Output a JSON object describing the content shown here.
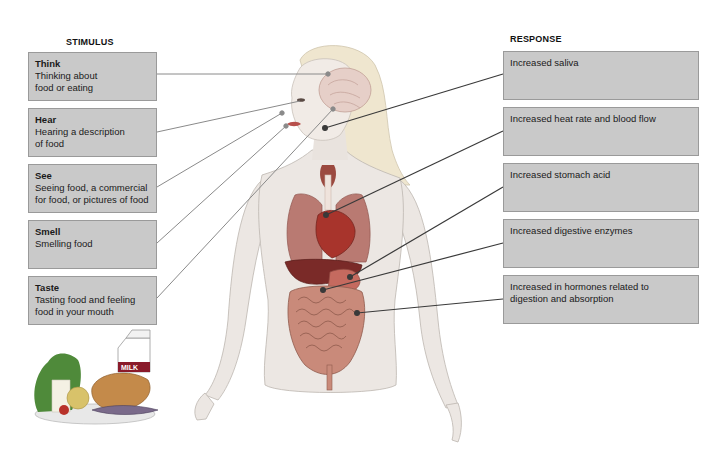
{
  "headers": {
    "stimulus": "STIMULUS",
    "response": "RESPONSE"
  },
  "stimuli": [
    {
      "title": "Think",
      "text": "Thinking about\nfood or eating"
    },
    {
      "title": "Hear",
      "text": "Hearing a description\nof food"
    },
    {
      "title": "See",
      "text": "Seeing food, a commercial\nfor food, or pictures of food"
    },
    {
      "title": "Smell",
      "text": "Smelling food"
    },
    {
      "title": "Taste",
      "text": "Tasting food and feeling\nfood in your mouth"
    }
  ],
  "responses": [
    {
      "text": "Increased saliva"
    },
    {
      "text": "Increased heat rate and blood flow"
    },
    {
      "text": "Increased stomach acid"
    },
    {
      "text": "Increased digestive enzymes"
    },
    {
      "text": "Increased in hormones related to\ndigestion and absorption"
    }
  ],
  "illustration": {
    "milk_label": "MILK",
    "figure": "human-body-anatomy",
    "food": "food-plate"
  },
  "colors": {
    "box_fill": "#c9c9c9",
    "box_border": "#9a9a9a",
    "stimulus_line": "#8a8a8a",
    "response_line": "#3a3a3a",
    "organ_red": "#b5463f",
    "liver": "#7a2a28",
    "skin": "#ece7e3"
  }
}
